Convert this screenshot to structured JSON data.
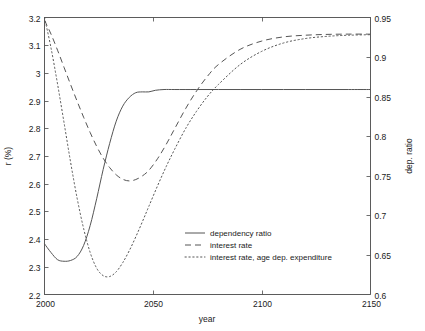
{
  "chart_data": {
    "type": "line",
    "title": "",
    "xlabel": "year",
    "ylabel": "r (%)",
    "ylabel_right": "dep. ratio",
    "xlim": [
      2000,
      2150
    ],
    "ylim": [
      2.2,
      3.2
    ],
    "ylim_right": [
      0.6,
      0.95
    ],
    "grid": false,
    "legend_position": "center",
    "xticks": [
      2000,
      2050,
      2100,
      2150
    ],
    "xtick_labels": [
      "2000",
      "2050",
      "2100",
      "2150"
    ],
    "yticks": [
      2.2,
      2.3,
      2.4,
      2.5,
      2.6,
      2.7,
      2.8,
      2.9,
      3.0,
      3.1,
      3.2
    ],
    "ytick_labels": [
      "2.2",
      "2.3",
      "2.4",
      "2.5",
      "2.6",
      "2.7",
      "2.8",
      "2.9",
      "3",
      "3.1",
      "3.2"
    ],
    "yticks_right": [
      0.6,
      0.65,
      0.7,
      0.75,
      0.8,
      0.85,
      0.9,
      0.95
    ],
    "ytick_labels_right": [
      "0.6",
      "0.65",
      "0.7",
      "0.75",
      "0.8",
      "0.85",
      "0.9",
      "0.95"
    ],
    "series": [
      {
        "name": "dependency ratio",
        "style": "solid",
        "axis": "right",
        "x": [
          2000,
          2003,
          2006,
          2009,
          2012,
          2015,
          2018,
          2021,
          2024,
          2027,
          2030,
          2033,
          2036,
          2039,
          2042,
          2045,
          2048,
          2051,
          2055,
          2060,
          2070,
          2080,
          2090,
          2100,
          2110,
          2120,
          2130,
          2140,
          2150
        ],
        "values": [
          2.375,
          2.345,
          2.327,
          2.32,
          2.322,
          2.338,
          2.378,
          2.448,
          2.545,
          2.65,
          2.745,
          2.825,
          2.88,
          2.912,
          2.928,
          2.93,
          2.932,
          2.938,
          2.94,
          2.94,
          2.94,
          2.94,
          2.94,
          2.94,
          2.94,
          2.94,
          2.94,
          2.94,
          2.94
        ],
        "values_right": [
          0.664,
          0.653,
          0.644,
          0.642,
          0.643,
          0.648,
          0.662,
          0.687,
          0.721,
          0.758,
          0.791,
          0.819,
          0.838,
          0.849,
          0.855,
          0.856,
          0.856,
          0.858,
          0.859,
          0.859,
          0.859,
          0.859,
          0.859,
          0.859,
          0.859,
          0.859,
          0.859,
          0.859,
          0.859
        ]
      },
      {
        "name": "interest rate",
        "style": "dashed",
        "axis": "left",
        "x": [
          2000,
          2003,
          2006,
          2009,
          2012,
          2015,
          2018,
          2021,
          2024,
          2027,
          2030,
          2033,
          2036,
          2039,
          2042,
          2045,
          2048,
          2052,
          2056,
          2060,
          2065,
          2070,
          2075,
          2080,
          2090,
          2100,
          2110,
          2120,
          2130,
          2140,
          2150
        ],
        "values": [
          3.19,
          3.14,
          3.082,
          3.02,
          2.958,
          2.898,
          2.84,
          2.785,
          2.735,
          2.692,
          2.658,
          2.632,
          2.616,
          2.61,
          2.615,
          2.628,
          2.648,
          2.69,
          2.742,
          2.8,
          2.872,
          2.935,
          2.988,
          3.03,
          3.085,
          3.115,
          3.13,
          3.136,
          3.139,
          3.14,
          3.14
        ]
      },
      {
        "name": "interest rate, age dep. expenditure",
        "style": "dotted",
        "axis": "left",
        "x": [
          2000,
          2003,
          2006,
          2009,
          2012,
          2015,
          2018,
          2021,
          2024,
          2027,
          2030,
          2033,
          2036,
          2039,
          2042,
          2045,
          2048,
          2052,
          2056,
          2060,
          2065,
          2070,
          2075,
          2080,
          2090,
          2100,
          2110,
          2120,
          2130,
          2140,
          2150
        ],
        "values": [
          3.2,
          3.09,
          2.96,
          2.82,
          2.678,
          2.548,
          2.438,
          2.352,
          2.295,
          2.268,
          2.265,
          2.282,
          2.315,
          2.358,
          2.408,
          2.462,
          2.518,
          2.592,
          2.662,
          2.726,
          2.8,
          2.862,
          2.915,
          2.958,
          3.03,
          3.078,
          3.108,
          3.124,
          3.132,
          3.136,
          3.138
        ]
      }
    ],
    "annotations": []
  },
  "legend": {
    "entries": [
      {
        "label": "dependency ratio",
        "style": "solid"
      },
      {
        "label": "interest rate",
        "style": "dashed"
      },
      {
        "label": "interest rate, age dep. expenditure",
        "style": "dotted"
      }
    ]
  },
  "colors": {
    "line": "#555555",
    "axis": "#4a4a4a",
    "text": "#1a1a1a",
    "background": "#ffffff"
  }
}
